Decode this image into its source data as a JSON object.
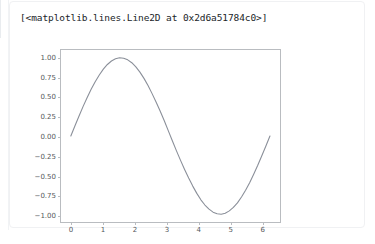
{
  "cell": {
    "output_repr": "[<matplotlib.lines.Line2D at 0x2d6a51784c0>]"
  },
  "colors": {
    "line": "#8a8f99",
    "axis": "#b9bcc0",
    "tick_label": "#55585c",
    "text": "#212529",
    "cell_border": "#f0f1f3",
    "gutter": "#e9ecef"
  },
  "chart_data": {
    "type": "line",
    "title": "",
    "xlabel": "",
    "ylabel": "",
    "xlim": [
      -0.31,
      6.6
    ],
    "ylim": [
      -1.1,
      1.1
    ],
    "grid": false,
    "legend": null,
    "xticks": [
      0,
      1,
      2,
      3,
      4,
      5,
      6
    ],
    "xticklabels": [
      "0",
      "1",
      "2",
      "3",
      "4",
      "5",
      "6"
    ],
    "yticks": [
      -1.0,
      -0.75,
      -0.5,
      -0.25,
      0.0,
      0.25,
      0.5,
      0.75,
      1.0
    ],
    "yticklabels": [
      "−1.00",
      "−0.75",
      "−0.50",
      "−0.25",
      "0.00",
      "0.25",
      "0.50",
      "0.75",
      "1.00"
    ],
    "series": [
      {
        "name": "sin(x)",
        "x": [
          0.0,
          0.128,
          0.256,
          0.385,
          0.513,
          0.641,
          0.769,
          0.898,
          1.026,
          1.154,
          1.282,
          1.41,
          1.539,
          1.667,
          1.795,
          1.923,
          2.052,
          2.18,
          2.308,
          2.436,
          2.564,
          2.693,
          2.821,
          2.949,
          3.077,
          3.206,
          3.334,
          3.462,
          3.59,
          3.718,
          3.847,
          3.975,
          4.103,
          4.231,
          4.36,
          4.488,
          4.616,
          4.744,
          4.872,
          5.001,
          5.129,
          5.257,
          5.385,
          5.514,
          5.642,
          5.77,
          5.898,
          6.026,
          6.155,
          6.283
        ],
        "y": [
          0.0,
          0.128,
          0.253,
          0.376,
          0.49,
          0.598,
          0.695,
          0.781,
          0.855,
          0.915,
          0.959,
          0.987,
          1.0,
          0.995,
          0.974,
          0.937,
          0.884,
          0.817,
          0.737,
          0.645,
          0.542,
          0.432,
          0.316,
          0.195,
          0.065,
          -0.064,
          -0.19,
          -0.312,
          -0.428,
          -0.538,
          -0.641,
          -0.734,
          -0.816,
          -0.883,
          -0.936,
          -0.974,
          -0.995,
          -1.0,
          -0.987,
          -0.958,
          -0.914,
          -0.855,
          -0.78,
          -0.694,
          -0.597,
          -0.489,
          -0.375,
          -0.252,
          -0.127,
          0.0
        ]
      }
    ]
  }
}
